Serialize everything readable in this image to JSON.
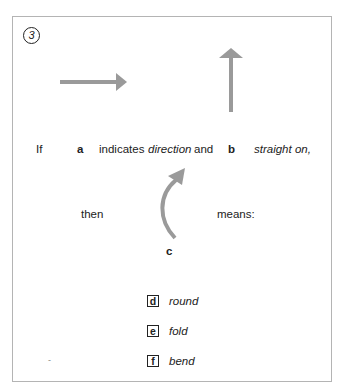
{
  "question": {
    "number": "3",
    "line1": {
      "prefix": "If",
      "label_a": "a",
      "middle": "indicates",
      "word_a": "direction",
      "conj": "and",
      "label_b": "b",
      "word_b": "straight on,"
    },
    "line2": {
      "prefix": "then",
      "suffix": "means:",
      "label_c": "c"
    },
    "options": [
      {
        "letter": "d",
        "text": "round"
      },
      {
        "letter": "e",
        "text": "fold"
      },
      {
        "letter": "f",
        "text": "bend"
      }
    ],
    "stray_mark": "-"
  },
  "arrows": {
    "color": "#9a9a9a",
    "a": "right-arrow",
    "b": "up-arrow",
    "c": "curved-up-arrow"
  }
}
